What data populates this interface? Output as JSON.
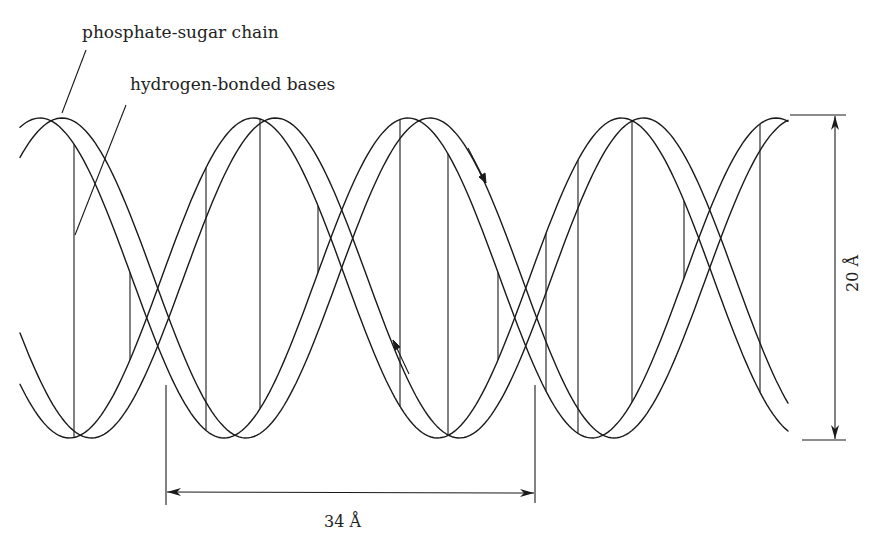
{
  "diagram": {
    "labels": {
      "backbone": "phosphate-sugar chain",
      "bases": "hydrogen-bonded bases",
      "pitch": "34 Å",
      "diameter": "20 Å"
    },
    "dimensions": {
      "pitch_angstrom": 34,
      "diameter_angstrom": 20
    },
    "strand_direction_arrows": [
      "down-right (upper strand)",
      "up-left (lower strand)"
    ],
    "colors": {
      "line": "#1a1a1a",
      "background": "#ffffff",
      "text": "#222222"
    }
  }
}
